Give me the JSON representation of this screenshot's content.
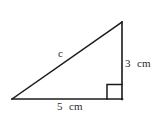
{
  "figure": {
    "type": "right-triangle-diagram",
    "background_color": "#ffffff",
    "stroke_color": "#1a1a1a",
    "text_color": "#2b2b2b",
    "labels": {
      "hypotenuse": "c",
      "vertical_leg": "3  cm",
      "base_leg": "5  cm"
    },
    "geometry": {
      "left_vertex": [
        12,
        99
      ],
      "right_vertex": [
        122,
        99
      ],
      "apex": [
        122,
        22
      ],
      "right_angle_marker_size": 15
    }
  }
}
